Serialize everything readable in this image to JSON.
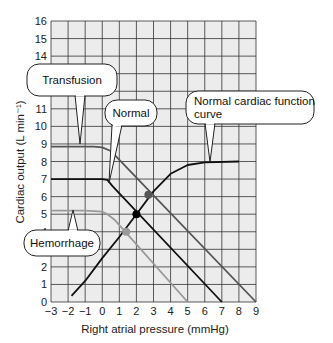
{
  "chart_data": {
    "type": "line",
    "title": "",
    "xlabel": "Right atrial pressure (mmHg)",
    "ylabel": "Cardiac output (L min⁻¹)",
    "xlim": [
      -3,
      9
    ],
    "ylim": [
      0,
      16
    ],
    "x_ticks": [
      "−3",
      "−2",
      "−1",
      "0",
      "1",
      "2",
      "3",
      "4",
      "5",
      "6",
      "7",
      "8",
      "9"
    ],
    "y_ticks": [
      "0",
      "1",
      "2",
      "3",
      "4",
      "5",
      "6",
      "7",
      "8",
      "9",
      "10",
      "11",
      "12",
      "13",
      "14",
      "15",
      "16"
    ],
    "grid": true,
    "background": "#ececec",
    "series": [
      {
        "name": "Normal cardiac function curve",
        "color": "#111111",
        "points": [
          [
            -1.8,
            0.35
          ],
          [
            -1,
            1.2
          ],
          [
            0,
            2.5
          ],
          [
            1,
            3.7
          ],
          [
            2,
            5.0
          ],
          [
            3,
            6.3
          ],
          [
            4,
            7.3
          ],
          [
            5,
            7.8
          ],
          [
            6,
            7.95
          ],
          [
            8,
            8.0
          ]
        ]
      },
      {
        "name": "Normal",
        "color": "#111111",
        "points": [
          [
            -3,
            7.0
          ],
          [
            0,
            7.0
          ],
          [
            0.3,
            6.95
          ],
          [
            0.6,
            6.6
          ],
          [
            7,
            0
          ]
        ]
      },
      {
        "name": "Transfusion",
        "color": "#555555",
        "points": [
          [
            -3,
            8.85
          ],
          [
            -0.5,
            8.85
          ],
          [
            0,
            8.8
          ],
          [
            0.5,
            8.6
          ],
          [
            1.2,
            7.9
          ],
          [
            9,
            0
          ]
        ]
      },
      {
        "name": "Hemorrhage",
        "color": "#999999",
        "points": [
          [
            -3,
            5.2
          ],
          [
            -1,
            5.2
          ],
          [
            0,
            5.15
          ],
          [
            0.3,
            5.0
          ],
          [
            0.7,
            4.7
          ],
          [
            5,
            0
          ]
        ]
      }
    ],
    "equilibrium_points": [
      {
        "label": "Normal",
        "x": 2.0,
        "y": 5.0,
        "color": "#000000"
      },
      {
        "label": "Transfusion",
        "x": 2.7,
        "y": 6.1,
        "color": "#555555"
      },
      {
        "label": "Hemorrhage",
        "x": 1.4,
        "y": 4.0,
        "color": "#999999"
      }
    ],
    "annotations": [
      {
        "text": "Transfusion",
        "box": [
          27,
          64,
          90,
          32
        ],
        "pointer": [
          80,
          144
        ]
      },
      {
        "text": "Normal",
        "box": [
          105,
          100,
          52,
          26
        ],
        "pointer": [
          109,
          183
        ]
      },
      {
        "text": "Normal cardiac function curve",
        "box": [
          186,
          91,
          128,
          33
        ],
        "pointer": [
          210,
          162
        ]
      },
      {
        "text": "Hemorrhage",
        "box": [
          24,
          230,
          76,
          26
        ],
        "pointer": [
          73,
          210
        ]
      }
    ]
  }
}
